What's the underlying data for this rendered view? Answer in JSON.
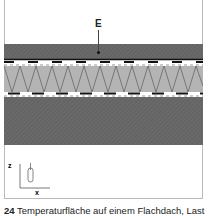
{
  "figure": {
    "label": "E",
    "axis_labels": {
      "vertical": "z",
      "horizontal": "x"
    },
    "caption_number": "24",
    "caption_text": "Temperaturfläche auf einem Flachdach, Last"
  },
  "colors": {
    "dark_layer": "#6a6a6a",
    "light_layer": "#b4b4b4",
    "line": "#111111",
    "frame": "#bbbbbb"
  }
}
